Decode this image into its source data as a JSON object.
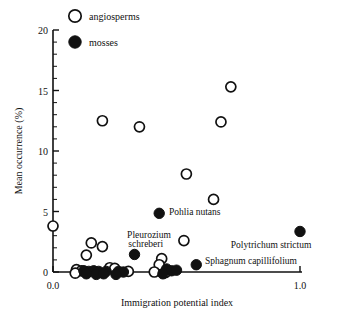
{
  "chart_data": {
    "type": "scatter",
    "title": "",
    "xlabel": "Immigration potential index",
    "ylabel": "Mean occurrence (%)",
    "xlim": [
      0.0,
      1.0
    ],
    "ylim": [
      0,
      20
    ],
    "xticks": [
      0.0,
      1.0
    ],
    "xticklabels": [
      "0.0",
      "1.0"
    ],
    "yticks": [
      0,
      5,
      10,
      15,
      20
    ],
    "yticklabels": [
      "0",
      "5",
      "10",
      "15",
      "20"
    ],
    "y_minor_step": 1,
    "grid": false,
    "legend_position": "top-left",
    "series": [
      {
        "name": "angiosperms",
        "marker": "open-circle",
        "color": "#ffffff",
        "edge_color": "#111111",
        "points": [
          {
            "x": 0.0,
            "y": 3.8
          },
          {
            "x": 0.2,
            "y": 12.5
          },
          {
            "x": 0.35,
            "y": 12.0
          },
          {
            "x": 0.72,
            "y": 15.3
          },
          {
            "x": 0.68,
            "y": 12.4
          },
          {
            "x": 0.54,
            "y": 8.1
          },
          {
            "x": 0.65,
            "y": 6.0
          },
          {
            "x": 0.53,
            "y": 2.6
          },
          {
            "x": 0.155,
            "y": 2.4
          },
          {
            "x": 0.2,
            "y": 2.1
          },
          {
            "x": 0.135,
            "y": 1.4
          },
          {
            "x": 0.44,
            "y": 1.1
          },
          {
            "x": 0.43,
            "y": 0.6
          },
          {
            "x": 0.095,
            "y": 0.2
          },
          {
            "x": 0.115,
            "y": 0.1
          },
          {
            "x": 0.23,
            "y": 0.35
          },
          {
            "x": 0.25,
            "y": 0.3
          },
          {
            "x": 0.305,
            "y": 0.05
          },
          {
            "x": 0.41,
            "y": 0.0
          },
          {
            "x": 0.455,
            "y": -0.05
          },
          {
            "x": 0.09,
            "y": -0.1
          }
        ]
      },
      {
        "name": "mosses",
        "marker": "filled-circle",
        "color": "#111111",
        "edge_color": "#111111",
        "points": [
          {
            "x": 0.43,
            "y": 4.85,
            "label": "Pohlia nutans"
          },
          {
            "x": 1.0,
            "y": 3.35,
            "label": "Polytrichum strictum"
          },
          {
            "x": 0.33,
            "y": 1.45,
            "label": "Pleurozium schreberi"
          },
          {
            "x": 0.58,
            "y": 0.6,
            "label": "Sphagnum capillifolium"
          },
          {
            "x": 0.125,
            "y": 0.1
          },
          {
            "x": 0.145,
            "y": 0.05
          },
          {
            "x": 0.165,
            "y": 0.1
          },
          {
            "x": 0.185,
            "y": 0.05
          },
          {
            "x": 0.215,
            "y": 0.05
          },
          {
            "x": 0.265,
            "y": 0.05
          },
          {
            "x": 0.285,
            "y": 0.0
          },
          {
            "x": 0.46,
            "y": 0.25
          },
          {
            "x": 0.48,
            "y": 0.1
          },
          {
            "x": 0.5,
            "y": 0.15
          },
          {
            "x": 0.445,
            "y": -0.15
          },
          {
            "x": 0.135,
            "y": -0.15
          },
          {
            "x": 0.175,
            "y": -0.2
          },
          {
            "x": 0.205,
            "y": -0.15
          },
          {
            "x": 0.255,
            "y": -0.2
          }
        ]
      }
    ],
    "annotations": [
      {
        "text": "Pohlia nutans",
        "x": 0.47,
        "y": 4.85
      },
      {
        "text": "Pleurozium",
        "x": 0.3,
        "y": 3.0
      },
      {
        "text": "schreberi",
        "x": 0.305,
        "y": 2.25
      },
      {
        "text": "Polytrichum strictum",
        "x": 0.72,
        "y": 2.2
      },
      {
        "text": "Sphagnum capillifolium",
        "x": 0.615,
        "y": 0.85
      }
    ]
  },
  "legend": {
    "items": [
      {
        "label": "angiosperms",
        "marker": "open-circle"
      },
      {
        "label": "mosses",
        "marker": "filled-circle"
      }
    ]
  },
  "axes": {
    "y_title": "Mean occurrence (%)",
    "x_title": "Immigration potential index",
    "y_labels": [
      "20",
      "15",
      "10",
      "5",
      "0"
    ],
    "x_labels": [
      "0.0",
      "1.0"
    ]
  }
}
